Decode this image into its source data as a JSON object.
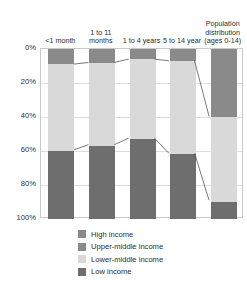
{
  "chart_data": {
    "type": "bar",
    "title": "",
    "subtitle": "",
    "xlabel": "",
    "ylabel": "",
    "ylim": [
      0,
      100
    ],
    "y_inverted": true,
    "grid": true,
    "stacked": true,
    "legend_position": "bottom",
    "y_ticks": [
      "0%",
      "20%",
      "40%",
      "60%",
      "80%",
      "100%"
    ],
    "y_tick_values": [
      0,
      20,
      40,
      60,
      80,
      100
    ],
    "categories": [
      "<1 month",
      "1 to 11 months",
      "1 to 4 years",
      "5 to 14 year",
      "Population distribution (ages 0-14)"
    ],
    "series": [
      {
        "name": "High income",
        "color": "#8a8a8a",
        "values": [
          3,
          3,
          2,
          2,
          14
        ]
      },
      {
        "name": "Upper-middle income",
        "color": "#8a8a8a",
        "values": [
          6,
          5,
          4,
          5,
          26
        ]
      },
      {
        "name": "Lower-middle income",
        "color": "#d9d9d9",
        "values": [
          51,
          49,
          47,
          55,
          50
        ]
      },
      {
        "name": "Low income",
        "color": "#6e6e6e",
        "values": [
          40,
          43,
          47,
          38,
          10
        ]
      }
    ],
    "segment_boundaries": {
      "top_dark_end": [
        9,
        8,
        6,
        7,
        40
      ],
      "bottom_dark_start": [
        60,
        57,
        53,
        62,
        90
      ]
    }
  },
  "legend": {
    "items": [
      {
        "label": "High income",
        "color": "#8a8a8a"
      },
      {
        "label": "Upper-middle income",
        "color": "#8a8a8a"
      },
      {
        "label": "Lower-middle income",
        "color": "#d9d9d9"
      },
      {
        "label": "Low income",
        "color": "#6e6e6e"
      }
    ]
  },
  "colors": {
    "high_income": "#8a8a8a",
    "upper_middle_income": "#8a8a8a",
    "lower_middle_income": "#d9d9d9",
    "low_income": "#6e6e6e",
    "grid": "#dddddd",
    "axis": "#c9c9c9",
    "connector": "#555555",
    "text": "#2e2e2e"
  }
}
